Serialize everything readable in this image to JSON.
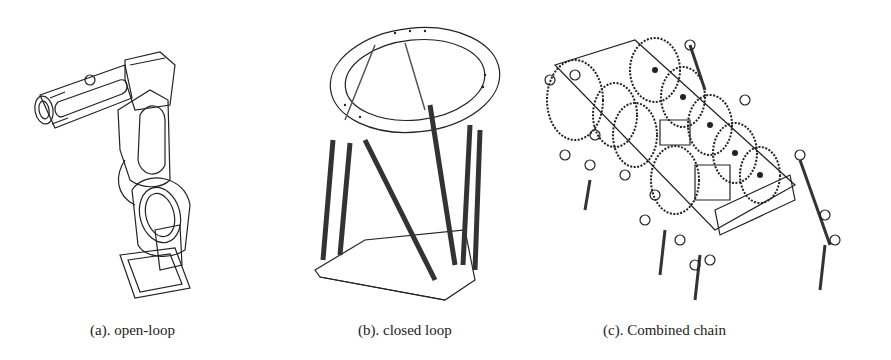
{
  "figure": {
    "panels": [
      {
        "id": "a",
        "caption": "(a). open-loop",
        "subject": "serial robot arm (6-axis manipulator)"
      },
      {
        "id": "b",
        "caption": "(b). closed loop",
        "subject": "parallel platform (Stewart/hexapod)"
      },
      {
        "id": "c",
        "caption": "(c). Combined chain",
        "subject": "multi-legged walking robot with gear trains"
      }
    ]
  }
}
